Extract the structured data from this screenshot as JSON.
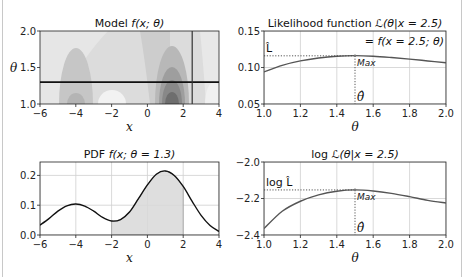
{
  "chart_data": [
    {
      "id": "model",
      "type": "heatmap",
      "title": "Model f(x; θ)",
      "xlabel": "x",
      "ylabel": "θ",
      "xlim": [
        -6,
        4
      ],
      "ylim": [
        1.0,
        2.0
      ],
      "xticks": [
        "−6",
        "−4",
        "−2",
        "0",
        "2",
        "4"
      ],
      "yticks": [
        "1.0",
        "1.5",
        "2.0"
      ],
      "colormap": "grayscale filled contours",
      "hline_theta": 1.3,
      "vline_x": 2.5,
      "grid": false
    },
    {
      "id": "likelihood",
      "type": "line",
      "title": "Likelihood function ℒ(θ|x = 2.5)",
      "subtitle": "= f(x = 2.5; θ)",
      "xlabel": "θ",
      "ylabel": "",
      "xlim": [
        1.0,
        2.0
      ],
      "ylim": [
        0.05,
        0.15
      ],
      "xticks": [
        "1.0",
        "1.2",
        "1.4",
        "1.6",
        "1.8",
        "2.0"
      ],
      "yticks": [
        "0.05",
        "0.10",
        "0.15"
      ],
      "x": [
        1.0,
        1.1,
        1.2,
        1.3,
        1.4,
        1.5,
        1.6,
        1.7,
        1.8,
        1.9,
        2.0
      ],
      "values": [
        0.094,
        0.103,
        0.109,
        0.113,
        0.1155,
        0.1163,
        0.1155,
        0.1137,
        0.1115,
        0.109,
        0.1065
      ],
      "max_point": {
        "x": 1.5,
        "y": 0.116
      },
      "annotations": [
        "L̂",
        "Max",
        "θ̂"
      ],
      "grid": true
    },
    {
      "id": "pdf",
      "type": "area",
      "title": "PDF f(x; θ = 1.3)",
      "xlabel": "x",
      "ylabel": "",
      "xlim": [
        -6,
        4
      ],
      "ylim": [
        0.0,
        0.245
      ],
      "xticks": [
        "−6",
        "−4",
        "−2",
        "0",
        "2",
        "4"
      ],
      "yticks": [
        "0.0",
        "0.1",
        "0.2"
      ],
      "x": [
        -6,
        -5.5,
        -5,
        -4.5,
        -4,
        -3.5,
        -3,
        -2.5,
        -2,
        -1.5,
        -1,
        -0.5,
        0,
        0.5,
        1,
        1.5,
        2,
        2.5,
        3,
        3.5,
        4
      ],
      "values": [
        0.033,
        0.055,
        0.08,
        0.098,
        0.104,
        0.097,
        0.08,
        0.059,
        0.047,
        0.052,
        0.077,
        0.122,
        0.168,
        0.204,
        0.215,
        0.2,
        0.163,
        0.113,
        0.066,
        0.032,
        0.012
      ],
      "shaded_range": [
        -2,
        2
      ],
      "grid": true
    },
    {
      "id": "loglikelihood",
      "type": "line",
      "title": "log ℒ(θ|x = 2.5)",
      "xlabel": "θ",
      "ylabel": "",
      "xlim": [
        1.0,
        2.0
      ],
      "ylim": [
        -2.4,
        -2.0
      ],
      "xticks": [
        "1.0",
        "1.2",
        "1.4",
        "1.6",
        "1.8",
        "2.0"
      ],
      "yticks": [
        "−2.4",
        "−2.2",
        "−2.0"
      ],
      "x": [
        1.0,
        1.1,
        1.2,
        1.3,
        1.4,
        1.5,
        1.6,
        1.7,
        1.8,
        1.9,
        2.0
      ],
      "values": [
        -2.365,
        -2.27,
        -2.215,
        -2.18,
        -2.16,
        -2.153,
        -2.159,
        -2.172,
        -2.19,
        -2.21,
        -2.225
      ],
      "max_point": {
        "x": 1.5,
        "y": -2.153
      },
      "annotations": [
        "log L̂",
        "Max",
        "θ̂"
      ],
      "grid": true
    }
  ],
  "labels": {
    "model_title_pre": "Model ",
    "model_title_math": "f(x; θ)",
    "lik_title_pre": "Likelihood function ",
    "lik_title_math": "ℒ(θ|x = 2.5)",
    "lik_subtitle": "= f(x = 2.5; θ)",
    "pdf_title_pre": "PDF ",
    "pdf_title_math": "f(x; θ = 1.3)",
    "log_title_pre": "log ",
    "log_title_math": "ℒ(θ|x = 2.5)",
    "x_label": "x",
    "theta_label": "θ",
    "lhat": "L̂",
    "loglhat": "log L̂",
    "max": "Max",
    "thetahat": "θ̂"
  }
}
